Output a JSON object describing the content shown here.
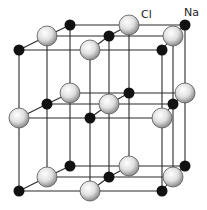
{
  "labels": {
    "cl": "Cl",
    "na": "Na"
  },
  "colors": {
    "line": "#2a2a2a",
    "na_fill": "#111111",
    "cl_fill_light": "#f4f4f4",
    "cl_fill_dark": "#9a9a9a",
    "cl_stroke": "#555555"
  },
  "lattice": {
    "columns": 3,
    "depth_rows": 3,
    "layers": 3,
    "rows": {
      "front": {
        "x": [
          19,
          90,
          162
        ],
        "dy": 0
      },
      "middle": {
        "x": [
          47,
          109,
          173
        ],
        "dy": -14
      },
      "back": {
        "x": [
          70,
          129,
          185
        ],
        "dy": -25
      }
    },
    "layer_y": [
      50,
      118,
      191
    ],
    "corner_ion": "Na"
  }
}
